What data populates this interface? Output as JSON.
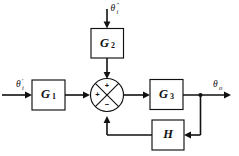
{
  "diagram": {
    "type": "block-diagram",
    "background_color": "#ffffff",
    "line_color": "#111111",
    "blocks": [
      {
        "id": "G1",
        "label": "G",
        "subscript": "1",
        "name": "block-g1"
      },
      {
        "id": "G2",
        "label": "G",
        "subscript": "2",
        "name": "block-g2"
      },
      {
        "id": "G3",
        "label": "G",
        "subscript": "3",
        "name": "block-g3"
      },
      {
        "id": "H",
        "label": "H",
        "subscript": "",
        "name": "block-h"
      }
    ],
    "signals": {
      "input_primary": {
        "base": "θ",
        "superscript": "′",
        "subscript": "i",
        "name": "signal-theta-i-prime"
      },
      "input_secondary": {
        "base": "θ",
        "superscript": "″",
        "subscript": "i",
        "name": "signal-theta-i-double-prime"
      },
      "output": {
        "base": "θ",
        "superscript": "",
        "subscript": "o",
        "name": "signal-theta-o"
      }
    },
    "summing_junction": {
      "name": "summing-junction",
      "style": "circle-with-cross",
      "signs": {
        "top": "+",
        "left": "+",
        "bottom": "−"
      }
    },
    "connections": [
      {
        "from": "input_primary",
        "to": "G1"
      },
      {
        "from": "G1",
        "to": "summing_junction"
      },
      {
        "from": "input_secondary",
        "to": "G2"
      },
      {
        "from": "G2",
        "to": "summing_junction"
      },
      {
        "from": "summing_junction",
        "to": "G3"
      },
      {
        "from": "G3",
        "to": "output"
      },
      {
        "from": "G3",
        "to": "H"
      },
      {
        "from": "H",
        "to": "summing_junction"
      }
    ]
  }
}
